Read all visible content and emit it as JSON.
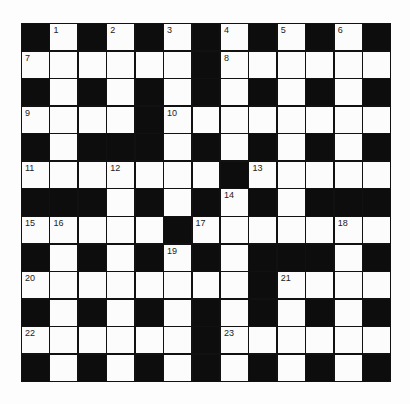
{
  "puzzle": {
    "rows": 13,
    "cols": 13,
    "grid": [
      "B1B2B3B4B5B6B",
      "7WWWWWB8WWWWW",
      "BWBWBWBWBWBWB",
      "9WWWB10WWWWWWW",
      "BWBBBWBWBWBWB",
      "11WW12WWWB13WWWW",
      "BBBWBWB14BWBBB",
      "15 16WWWB17WWWW18W",
      "BWBWB19BWBBBWB",
      "20WWWWWWWB21WWW",
      "BWBWBWBWBWBWB",
      "22WWWWWB23WWWWW",
      "BWBWBWBWBWBWB"
    ],
    "cells": [
      [
        "B",
        "1",
        "B",
        "2",
        "B",
        "3",
        "B",
        "4",
        "B",
        "5",
        "B",
        "6",
        "B"
      ],
      [
        "7",
        "W",
        "W",
        "W",
        "W",
        "W",
        "B",
        "8",
        "W",
        "W",
        "W",
        "W",
        "W"
      ],
      [
        "B",
        "W",
        "B",
        "W",
        "B",
        "W",
        "B",
        "W",
        "B",
        "W",
        "B",
        "W",
        "B"
      ],
      [
        "9",
        "W",
        "W",
        "W",
        "B",
        "10",
        "W",
        "W",
        "W",
        "W",
        "W",
        "W",
        "W"
      ],
      [
        "B",
        "W",
        "B",
        "B",
        "B",
        "W",
        "B",
        "W",
        "B",
        "W",
        "B",
        "W",
        "B"
      ],
      [
        "11",
        "W",
        "W",
        "12",
        "W",
        "W",
        "W",
        "B",
        "13",
        "W",
        "W",
        "W",
        "W"
      ],
      [
        "B",
        "B",
        "B",
        "W",
        "B",
        "W",
        "B",
        "14",
        "B",
        "W",
        "B",
        "B",
        "B"
      ],
      [
        "15",
        "16",
        "W",
        "W",
        "W",
        "B",
        "17",
        "W",
        "W",
        "W",
        "W",
        "18",
        "W"
      ],
      [
        "B",
        "W",
        "B",
        "W",
        "B",
        "19",
        "B",
        "W",
        "B",
        "B",
        "B",
        "W",
        "B"
      ],
      [
        "20",
        "W",
        "W",
        "W",
        "W",
        "W",
        "W",
        "W",
        "B",
        "21",
        "W",
        "W",
        "W"
      ],
      [
        "B",
        "W",
        "B",
        "W",
        "B",
        "W",
        "B",
        "W",
        "B",
        "W",
        "B",
        "W",
        "B"
      ],
      [
        "22",
        "W",
        "W",
        "W",
        "W",
        "W",
        "B",
        "23",
        "W",
        "W",
        "W",
        "W",
        "W"
      ],
      [
        "B",
        "W",
        "B",
        "W",
        "B",
        "W",
        "B",
        "W",
        "B",
        "W",
        "B",
        "W",
        "B"
      ]
    ],
    "clue_numbers": [
      "1",
      "2",
      "3",
      "4",
      "5",
      "6",
      "7",
      "8",
      "9",
      "10",
      "11",
      "12",
      "13",
      "14",
      "15",
      "16",
      "17",
      "18",
      "19",
      "20",
      "21",
      "22",
      "23"
    ],
    "colors": {
      "block": "#0d0d0d",
      "cell": "#fcfcfc",
      "line": "#111111",
      "number": "#222222",
      "background": "#fdfdfd"
    }
  }
}
